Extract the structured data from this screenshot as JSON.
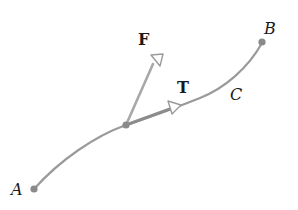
{
  "diagram": {
    "type": "vector-field-along-curve",
    "curve": {
      "name": "C",
      "start": "A",
      "end": "B"
    },
    "labels": {
      "start_point": "A",
      "end_point": "B",
      "curve": "C",
      "force_vector": "F",
      "tangent_vector": "T"
    },
    "colors": {
      "curve": "#9a9a9a",
      "point": "#8a8a8a",
      "vector": "#a8a8a8",
      "arrowhead_fill": "#ffffff",
      "label": "#1a1a1a"
    }
  }
}
